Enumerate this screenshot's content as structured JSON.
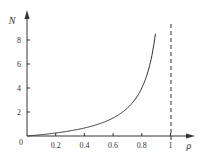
{
  "chart_data": {
    "type": "line",
    "title": "",
    "xlabel": "ρ",
    "ylabel": "N",
    "xlim": [
      0,
      1.05
    ],
    "ylim": [
      0,
      10
    ],
    "grid": false,
    "legend": null,
    "x_ticks": [
      "0.2",
      "0.4",
      "0.6",
      "0.8",
      "1"
    ],
    "y_ticks": [
      "2",
      "4",
      "6",
      "8"
    ],
    "origin_label": "0",
    "series": [
      {
        "name": "N = ρ/(1-ρ)",
        "x": [
          0,
          0.1,
          0.2,
          0.3,
          0.4,
          0.5,
          0.6,
          0.7,
          0.8,
          0.85,
          0.9,
          0.93,
          0.955
        ],
        "values": [
          0,
          0.11,
          0.25,
          0.43,
          0.67,
          1.0,
          1.5,
          2.33,
          4.0,
          5.67,
          9.0,
          13.3,
          21.2
        ]
      }
    ],
    "annotations": [
      {
        "type": "vertical-dashed-line",
        "x": 1,
        "label": "asymptote at ρ = 1"
      }
    ],
    "colors": {
      "curve": "#333333",
      "axes": "#333333",
      "asymptote": "#333333"
    }
  }
}
